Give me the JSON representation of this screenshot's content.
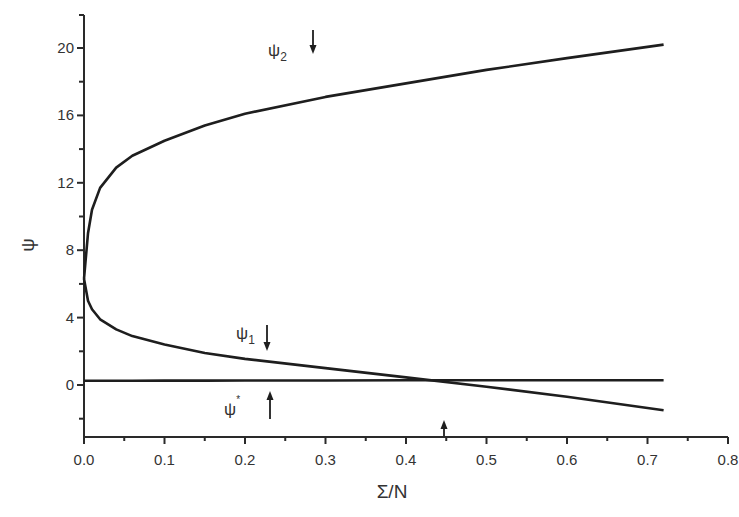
{
  "chart_data": {
    "type": "line",
    "title": "",
    "xlabel": "Σ/N",
    "ylabel": "ψ",
    "xlim": [
      0.0,
      0.8
    ],
    "ylim": [
      -3,
      22
    ],
    "grid": false,
    "legend": "none (curves labeled inline)",
    "x_ticks": [
      "0.0",
      "0.1",
      "0.2",
      "0.3",
      "0.4",
      "0.5",
      "0.6",
      "0.7",
      "0.8"
    ],
    "y_ticks": [
      "0",
      "4",
      "8",
      "12",
      "16",
      "20"
    ],
    "x": [
      0.0,
      0.005,
      0.01,
      0.02,
      0.04,
      0.06,
      0.1,
      0.15,
      0.2,
      0.3,
      0.4,
      0.5,
      0.6,
      0.72
    ],
    "series": [
      {
        "name": "ψ2",
        "values": [
          6.3,
          9.0,
          10.4,
          11.7,
          12.9,
          13.6,
          14.5,
          15.4,
          16.1,
          17.1,
          17.9,
          18.7,
          19.4,
          20.2
        ]
      },
      {
        "name": "ψ1",
        "values": [
          6.3,
          5.0,
          4.5,
          3.9,
          3.3,
          2.9,
          2.4,
          1.9,
          1.55,
          1.0,
          0.45,
          -0.1,
          -0.7,
          -1.5
        ]
      },
      {
        "name": "ψ*",
        "values": [
          0.25,
          0.25,
          0.25,
          0.25,
          0.25,
          0.25,
          0.26,
          0.26,
          0.27,
          0.27,
          0.28,
          0.28,
          0.28,
          0.28
        ]
      }
    ],
    "annotations": [
      {
        "text": "ψ2",
        "x": 0.24,
        "y": 20.6,
        "arrow": "down",
        "arrow_x": 0.29
      },
      {
        "text": "ψ1",
        "x": 0.19,
        "y": 2.6,
        "arrow": "down",
        "arrow_x": 0.23
      },
      {
        "text": "ψ*",
        "x": 0.19,
        "y": -1.5,
        "arrow": "up",
        "arrow_x": 0.235
      },
      {
        "text": "",
        "x": 0.455,
        "y": -2.5,
        "arrow": "up",
        "arrow_x": 0.455
      }
    ]
  },
  "labels": {
    "psi2_main": "ψ",
    "psi2_sub": "2",
    "psi1_main": "ψ",
    "psi1_sub": "1",
    "psistar_main": "ψ",
    "psistar_sup": "*"
  }
}
